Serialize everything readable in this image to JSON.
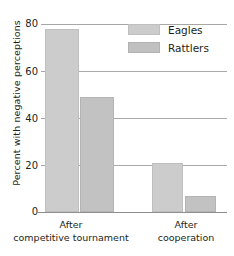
{
  "chart_data": {
    "type": "bar",
    "title": "",
    "xlabel": "",
    "ylabel": "Percent with negative perceptions",
    "categories": [
      "After competitive tournament",
      "After cooperation"
    ],
    "category_lines": [
      [
        "After",
        "competitive tournament"
      ],
      [
        "After",
        "cooperation"
      ]
    ],
    "series": [
      {
        "name": "Eagles",
        "values": [
          78,
          21
        ]
      },
      {
        "name": "Rattlers",
        "values": [
          49,
          7
        ]
      }
    ],
    "ylim": [
      0,
      80
    ],
    "yticks": [
      0,
      20,
      40,
      60,
      80
    ],
    "ytick_labels": [
      "0",
      "20",
      "40",
      "60",
      "80"
    ],
    "grid": true,
    "legend_position": "top-right-inside",
    "colors": {
      "eagles_fill": "#cccccc",
      "rattlers_fill": "#c2c2c2",
      "bar_border": "#b4b4b4",
      "gridline": "#a9a9a9",
      "axis": "#8f8f8f",
      "text": "#231f20",
      "background": "#ffffff"
    }
  },
  "axis": {
    "y_title": "Percent with negative perceptions",
    "tick_80": "80",
    "tick_60": "60",
    "tick_40": "40",
    "tick_20": "20",
    "tick_0": "0"
  },
  "legend": {
    "items": [
      {
        "label": "Eagles"
      },
      {
        "label": "Rattlers"
      }
    ]
  },
  "categories": [
    {
      "line1": "After",
      "line2": "competitive tournament"
    },
    {
      "line1": "After",
      "line2": "cooperation"
    }
  ]
}
